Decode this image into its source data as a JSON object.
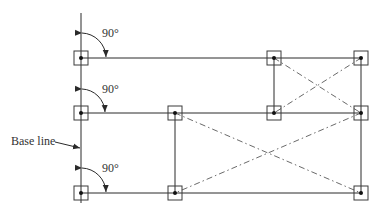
{
  "diagram": {
    "title": "",
    "base_line_label": "Base line",
    "angle_labels": [
      "90°",
      "90°",
      "90°"
    ],
    "colors": {
      "line": "#2a2a2a",
      "dashed": "#6a6a6a",
      "text": "#333333"
    },
    "nodes": [
      {
        "id": "A1",
        "x": 81,
        "y": 58
      },
      {
        "id": "A2",
        "x": 81,
        "y": 113
      },
      {
        "id": "A3",
        "x": 81,
        "y": 193
      },
      {
        "id": "C1",
        "x": 274,
        "y": 58
      },
      {
        "id": "D1",
        "x": 361,
        "y": 58
      },
      {
        "id": "B2",
        "x": 175,
        "y": 113
      },
      {
        "id": "C2",
        "x": 274,
        "y": 113
      },
      {
        "id": "D2",
        "x": 361,
        "y": 113
      },
      {
        "id": "B3",
        "x": 175,
        "y": 193
      },
      {
        "id": "D3",
        "x": 361,
        "y": 193
      }
    ],
    "solid_edges": [
      [
        "A1",
        "D1"
      ],
      [
        "A2",
        "D2"
      ],
      [
        "A3",
        "D3"
      ],
      [
        "C1",
        "C2"
      ],
      [
        "D1",
        "D3"
      ],
      [
        "B2",
        "B3"
      ]
    ],
    "dashed_diagonals": [
      [
        "C1",
        "D2"
      ],
      [
        "D1",
        "C2"
      ],
      [
        "B2",
        "D3"
      ],
      [
        "D2",
        "B3"
      ]
    ]
  }
}
